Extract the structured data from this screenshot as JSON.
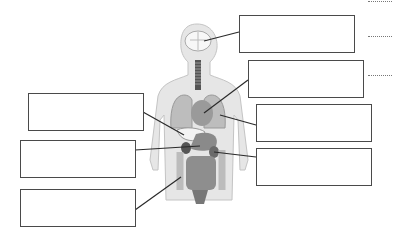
{
  "diagram": {
    "organs_depicted": [
      "brain",
      "trachea",
      "lungs",
      "heart",
      "liver",
      "stomach",
      "kidney",
      "large-intestine",
      "small-intestine"
    ],
    "label_boxes_left": [
      {
        "id": "left-1",
        "text": "",
        "points_to": "liver"
      },
      {
        "id": "left-2",
        "text": "",
        "points_to": "stomach"
      },
      {
        "id": "left-3",
        "text": "",
        "points_to": "large-intestine"
      }
    ],
    "label_boxes_right": [
      {
        "id": "right-1",
        "text": "",
        "points_to": "brain"
      },
      {
        "id": "right-2",
        "text": "",
        "points_to": "heart"
      },
      {
        "id": "right-3",
        "text": "",
        "points_to": "lungs"
      },
      {
        "id": "right-4",
        "text": "",
        "points_to": "kidney"
      }
    ],
    "answer_lines": [
      "",
      "",
      ""
    ],
    "colors": {
      "body": "#e2e2e2",
      "organs": "#9a9a9a",
      "organs_dark": "#6e6e6e",
      "outline": "#4a4a4a"
    }
  }
}
